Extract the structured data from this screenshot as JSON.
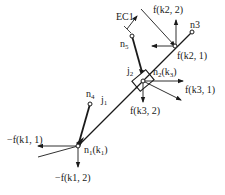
{
  "diagram": {
    "type": "mechanism-free-body",
    "stroke_color": "#1a1a1a",
    "background": "#ffffff",
    "labels": {
      "ec1": "EC1",
      "f_k2_2": "f(k2, 2)",
      "n3": "n3",
      "n5_base": "n",
      "n5_sub": "5",
      "f_k2_1": "f(k2, 1)",
      "j2_base": "j",
      "j2_sub": "2",
      "n2_base": "n",
      "n2_sub": "2",
      "n2_k_open": "(k",
      "n2_k_sub": "3",
      "n2_k_close": ")",
      "f_k3_1": "f(k3, 1)",
      "f_k3_2": "f(k3, 2)",
      "n4_base": "n",
      "n4_sub": "4",
      "j1_base": "j",
      "j1_sub": "1",
      "neg_f_k1_1": "−f(k1, 1)",
      "n1_base": "n",
      "n1_sub": "1",
      "n1_k_open": "(k",
      "n1_k_sub": "1",
      "n1_k_close": ")",
      "neg_f_k1_2": "−f(k1, 2)"
    }
  }
}
